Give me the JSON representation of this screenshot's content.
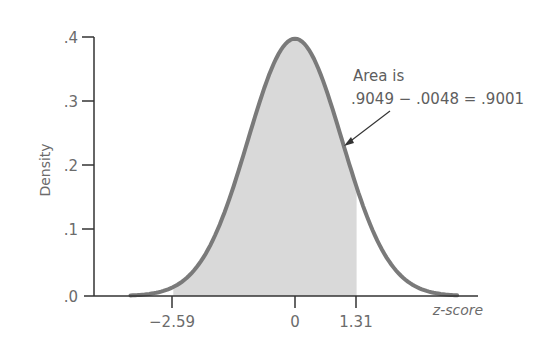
{
  "chart_data": {
    "type": "area",
    "title": "",
    "xlabel": "z-score",
    "ylabel": "Density",
    "xlim": [
      -3.5,
      3.5
    ],
    "ylim": [
      0,
      0.4
    ],
    "grid": false,
    "y_ticks": [
      ".0",
      ".1",
      ".2",
      ".3",
      ".4"
    ],
    "y_tick_values": [
      0,
      0.1,
      0.2,
      0.3,
      0.4
    ],
    "x_ticks": [
      "-2.59",
      "0",
      "1.31"
    ],
    "x_tick_values": [
      -2.59,
      0,
      1.31
    ],
    "curve": "standard normal density",
    "shaded_region": {
      "from": -2.59,
      "to": 1.31
    },
    "annotation": {
      "line1": "Area is",
      "line2": ".9049 − .0048 = .9001",
      "cumulative_upper": 0.9049,
      "cumulative_lower": 0.0048,
      "area": 0.9001
    },
    "colors": {
      "curve": "#7a7a7a",
      "fill": "#d9d9d9",
      "axis": "#333333",
      "text": "#6b6b6b"
    }
  },
  "labels": {
    "y_axis": "Density",
    "x_axis": "z-score",
    "annotation_line1": "Area is",
    "annotation_line2": ".9049 − .0048 = .9001",
    "ytick_0": ".0",
    "ytick_1": ".1",
    "ytick_2": ".2",
    "ytick_3": ".3",
    "ytick_4": ".4",
    "xtick_neg": "−2.59",
    "xtick_zero": "0",
    "xtick_pos": "1.31"
  }
}
